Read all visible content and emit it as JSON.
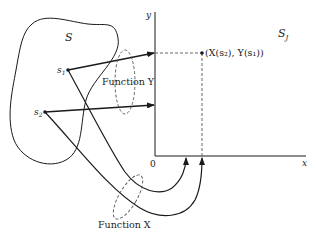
{
  "diagram": {
    "set_label": "S",
    "range_label": "S",
    "range_label_sub": "J",
    "point_s1": {
      "label": "s",
      "sub": "1"
    },
    "point_s2": {
      "label": "s",
      "sub": "2"
    },
    "function_y_label": "Function Y",
    "function_x_label": "Function X",
    "axis_y_label": "y",
    "axis_x_label": "x",
    "origin_label": "0",
    "mapped_point_label": "(X(s₂), Y(s₁))"
  },
  "colors": {
    "ink": "#1a1a1a",
    "dashed": "#555555",
    "background": "#ffffff"
  }
}
